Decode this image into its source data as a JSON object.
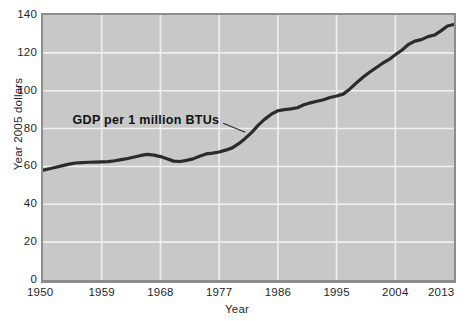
{
  "chart_data": {
    "type": "line",
    "title": "",
    "xlabel": "Year",
    "ylabel": "Year 2005 dollars",
    "xlim": [
      1950,
      2013
    ],
    "ylim": [
      0,
      140
    ],
    "grid": true,
    "legend_position": "none",
    "annotations": [
      {
        "text": "GDP per 1 million BTUs",
        "points_to_x": 1981,
        "points_to_y": 78
      }
    ],
    "xticks": [
      1950,
      1959,
      1968,
      1977,
      1986,
      1995,
      2004,
      2013
    ],
    "ytick_labels": [
      "0",
      "20",
      "40",
      "60",
      "80",
      "100",
      "120",
      "140"
    ],
    "yticks": [
      0,
      20,
      40,
      60,
      80,
      100,
      120,
      140
    ],
    "series": [
      {
        "name": "GDP per 1 million BTUs",
        "color": "#2b2b2b",
        "x": [
          1950,
          1951,
          1952,
          1953,
          1954,
          1955,
          1956,
          1957,
          1958,
          1959,
          1960,
          1961,
          1962,
          1963,
          1964,
          1965,
          1966,
          1967,
          1968,
          1969,
          1970,
          1971,
          1972,
          1973,
          1974,
          1975,
          1976,
          1977,
          1978,
          1979,
          1980,
          1981,
          1982,
          1983,
          1984,
          1985,
          1986,
          1987,
          1988,
          1989,
          1990,
          1991,
          1992,
          1993,
          1994,
          1995,
          1996,
          1997,
          1998,
          1999,
          2000,
          2001,
          2002,
          2003,
          2004,
          2005,
          2006,
          2007,
          2008,
          2009,
          2010,
          2011,
          2012,
          2013
        ],
        "y": [
          58.0,
          58.8,
          59.6,
          60.4,
          61.2,
          61.8,
          62.0,
          62.2,
          62.3,
          62.4,
          62.5,
          63.0,
          63.6,
          64.2,
          65.0,
          65.8,
          66.4,
          66.0,
          65.2,
          64.0,
          62.8,
          62.6,
          63.2,
          64.0,
          65.4,
          66.6,
          67.0,
          67.6,
          68.6,
          69.8,
          72.0,
          74.8,
          78.0,
          81.8,
          85.0,
          87.6,
          89.4,
          90.0,
          90.4,
          91.0,
          92.6,
          93.6,
          94.4,
          95.2,
          96.4,
          97.2,
          98.2,
          100.8,
          104.0,
          107.0,
          109.6,
          112.0,
          114.4,
          116.4,
          119.0,
          121.4,
          124.4,
          126.2,
          127.0,
          128.6,
          129.4,
          131.6,
          134.2,
          135.0
        ]
      }
    ]
  },
  "axes": {
    "y_title": "Year 2005 dollars",
    "x_title": "Year"
  },
  "colors": {
    "plot_background": "#c8c8c8",
    "gridline": "#f0f0f0",
    "series_line": "#2b2b2b",
    "axis_frame": "#8d8d8d",
    "text": "#1f1f1f"
  }
}
